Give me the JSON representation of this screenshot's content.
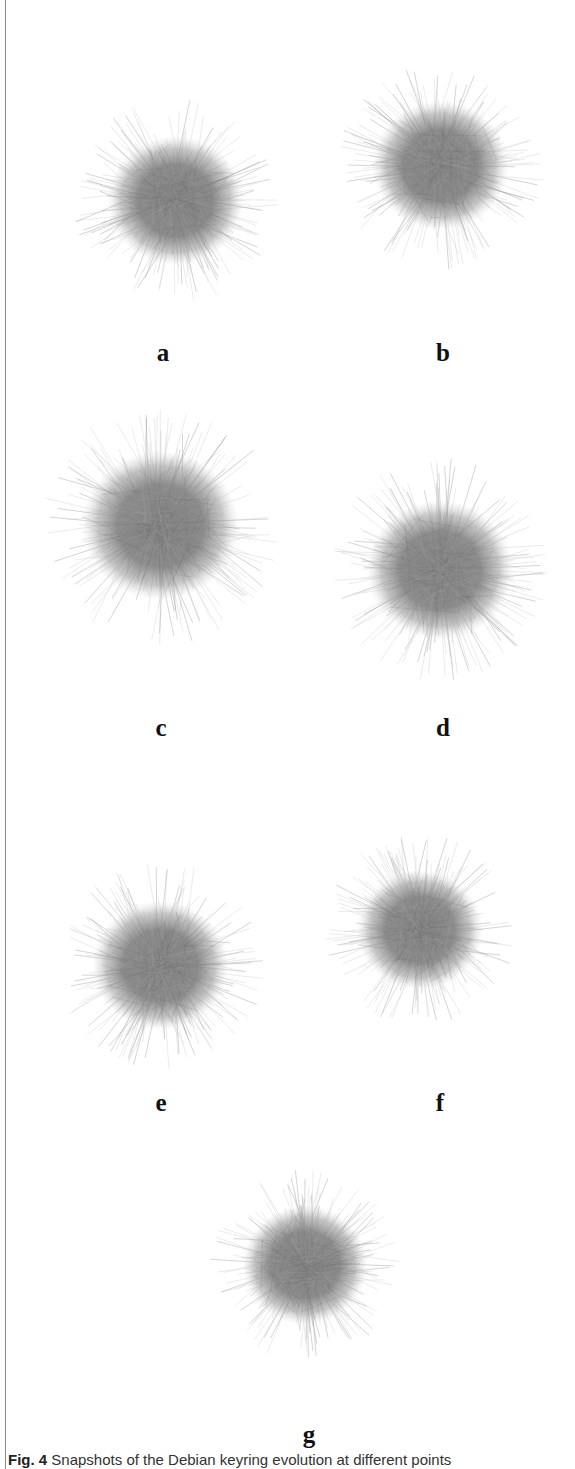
{
  "figure": {
    "panels": [
      {
        "label": "a",
        "cx": 175,
        "cy": 200,
        "r": 65,
        "label_x": 163,
        "label_y": 340
      },
      {
        "label": "b",
        "cx": 440,
        "cy": 165,
        "r": 65,
        "label_x": 443,
        "label_y": 340
      },
      {
        "label": "c",
        "cx": 160,
        "cy": 525,
        "r": 75,
        "label_x": 161,
        "label_y": 715
      },
      {
        "label": "d",
        "cx": 440,
        "cy": 570,
        "r": 70,
        "label_x": 443,
        "label_y": 715
      },
      {
        "label": "e",
        "cx": 160,
        "cy": 965,
        "r": 65,
        "label_x": 161,
        "label_y": 1090
      },
      {
        "label": "f",
        "cx": 420,
        "cy": 930,
        "r": 60,
        "label_x": 440,
        "label_y": 1090
      },
      {
        "label": "g",
        "cx": 305,
        "cy": 1265,
        "r": 60,
        "label_x": 309,
        "label_y": 1422
      }
    ],
    "colors": {
      "core": "#7a7a7a",
      "mid": "#9a9a9a",
      "halo": "#cfcfcf",
      "rule": "#8a8a8a"
    }
  },
  "caption": {
    "fig_label": "Fig. 4",
    "text": " Snapshots of the Debian keyring evolution at different points"
  }
}
